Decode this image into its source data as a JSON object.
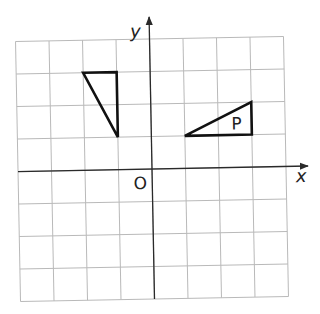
{
  "diagram": {
    "type": "coordinate-grid",
    "grid": {
      "x_min": -4,
      "x_max": 4,
      "y_min": -4,
      "y_max": 4,
      "cell_px_w": 33.5,
      "cell_px_h": 32.5,
      "origin_px": [
        152,
        169
      ],
      "rotation_deg": -1.1,
      "grid_color": "#b9b9b9",
      "axis_color": "#2a2a2a"
    },
    "axes": {
      "x_label": "x",
      "y_label": "y",
      "origin_label": "O"
    },
    "shapes": [
      {
        "name": "triangle-unlabeled",
        "label": "",
        "vertices": [
          [
            -2,
            3
          ],
          [
            -1,
            3
          ],
          [
            -1,
            1
          ]
        ]
      },
      {
        "name": "triangle-p",
        "label": "P",
        "vertices": [
          [
            1,
            1
          ],
          [
            3,
            1
          ],
          [
            3,
            2
          ]
        ],
        "label_pos": [
          2.55,
          1.35
        ]
      }
    ],
    "stroke_color": "#111111"
  }
}
